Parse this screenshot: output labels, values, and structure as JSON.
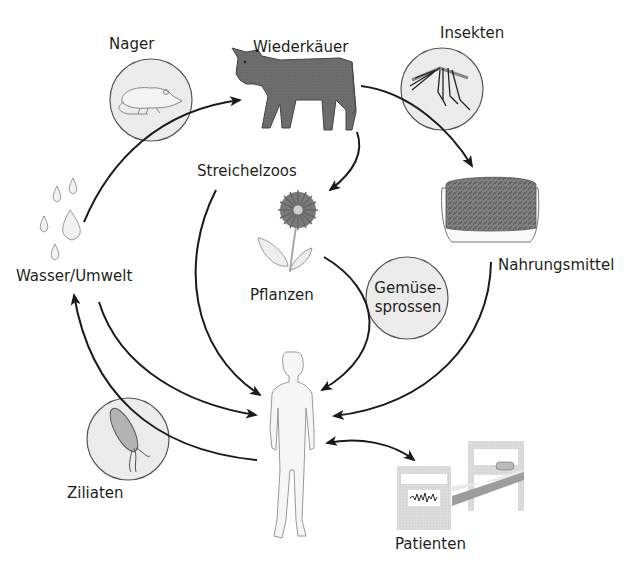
{
  "diagram": {
    "type": "transmission-cycle",
    "language": "de",
    "nodes": {
      "nager": {
        "label": "Nager",
        "icon": "rat-icon"
      },
      "wiederkaeuer": {
        "label": "Wiederkäuer",
        "icon": "cow-icon"
      },
      "insekten": {
        "label": "Insekten",
        "icon": "mosquito-icon"
      },
      "nahrungsmittel": {
        "label": "Nahrungsmittel",
        "icon": "food-tray-icon"
      },
      "streichelzoos": {
        "label": "Streichelzoos"
      },
      "pflanzen": {
        "label": "Pflanzen",
        "icon": "flower-icon"
      },
      "gemuesesprossen": {
        "label_line1": "Gemüse-",
        "label_line2": "sprossen"
      },
      "wasser": {
        "label": "Wasser/Umwelt",
        "icon": "water-drops-icon"
      },
      "ziliaten": {
        "label": "Ziliaten",
        "icon": "ciliate-bacterium-icon"
      },
      "mensch": {
        "icon": "human-figure-icon"
      },
      "patienten": {
        "label": "Patienten",
        "icon": "hospital-bed-icon"
      }
    },
    "edges": [
      {
        "from": "Wasser/Umwelt",
        "to": "Wiederkäuer"
      },
      {
        "from": "Wiederkäuer",
        "to": "Nahrungsmittel"
      },
      {
        "from": "Wiederkäuer",
        "to": "Pflanzen"
      },
      {
        "from": "Streichelzoos",
        "to": "Mensch"
      },
      {
        "from": "Pflanzen",
        "to": "Mensch",
        "via": "Gemüsesprossen"
      },
      {
        "from": "Nahrungsmittel",
        "to": "Mensch"
      },
      {
        "from": "Wasser/Umwelt",
        "to": "Mensch"
      },
      {
        "from": "Mensch",
        "to": "Wasser/Umwelt"
      },
      {
        "from": "Mensch",
        "to": "Patienten",
        "bidirectional": true
      }
    ],
    "colors": {
      "line": "#1a1a1a",
      "bubble_fill": "#ececec",
      "bubble_stroke": "#555555",
      "cow": "#6b6b6b",
      "food": "#7a7a7a",
      "bed": "#d9d9d9"
    }
  }
}
